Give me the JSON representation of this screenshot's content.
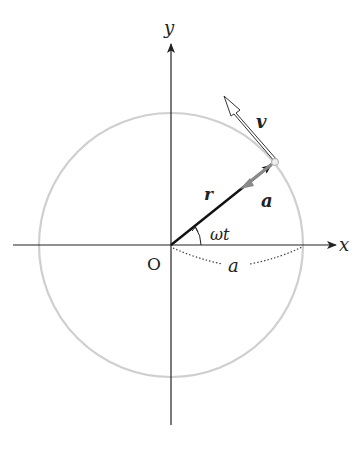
{
  "diagram": {
    "labels": {
      "x_axis": "x",
      "y_axis": "y",
      "origin": "O",
      "radius_vector": "r",
      "velocity_vector": "v",
      "acceleration_vector": "a",
      "angle": "ωt",
      "radius_length": "a"
    },
    "colors": {
      "axes": "#222222",
      "circle": "#cfcfcf",
      "radius_vector": "#111111",
      "velocity_outline": "#333333",
      "acceleration": "#8a8a8a",
      "dotted_arc": "#444444"
    },
    "geometry": {
      "origin": [
        171,
        245
      ],
      "circle_radius": 132,
      "point_on_circle": [
        275,
        162
      ],
      "velocity_tip": [
        225,
        97
      ]
    }
  }
}
